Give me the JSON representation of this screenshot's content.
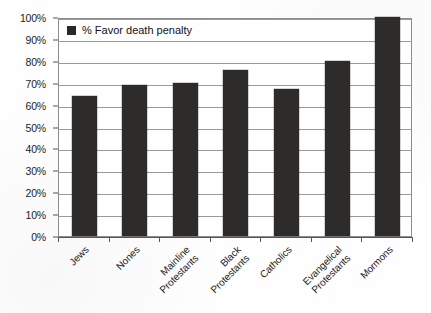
{
  "chart_data": {
    "type": "bar",
    "title": "",
    "subtitle": "",
    "xlabel": "",
    "ylabel": "",
    "ylim": [
      0,
      100
    ],
    "grid": true,
    "legend_position": "top-left-inside",
    "categories": [
      "Jews",
      "Nones",
      "Mainline Protestants",
      "Black Protestants",
      "Catholics",
      "Evangelical Protestants",
      "Mormons"
    ],
    "category_lines": [
      [
        "Jews"
      ],
      [
        "Nones"
      ],
      [
        "Mainline",
        "Protestants"
      ],
      [
        "Black",
        "Protestants"
      ],
      [
        "Catholics"
      ],
      [
        "Evangelical",
        "Protestants"
      ],
      [
        "Mormons"
      ]
    ],
    "series": [
      {
        "name": "% Favor death penalty",
        "color": "#2e2b2b",
        "values": [
          64,
          69,
          70,
          76,
          67,
          80,
          100
        ]
      }
    ],
    "y_ticks": [
      "0%",
      "10%",
      "20%",
      "30%",
      "40%",
      "50%",
      "60%",
      "70%",
      "80%",
      "90%",
      "100%"
    ],
    "y_tick_values": [
      0,
      10,
      20,
      30,
      40,
      50,
      60,
      70,
      80,
      90,
      100
    ]
  },
  "legend": {
    "marker": "filled-square-marker",
    "label": "% Favor death penalty"
  },
  "colors": {
    "bar": "#2e2b2b",
    "gridline": "#9a9a9a",
    "axis": "#555555",
    "text": "#1d1d1d",
    "background": "#fefefe"
  }
}
